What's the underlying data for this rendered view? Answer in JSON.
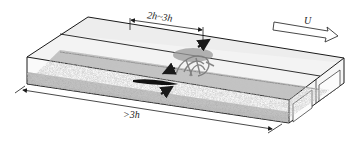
{
  "diagram": {
    "labels": {
      "spacing": "2h~3h",
      "length": ">3h",
      "flow": "U"
    },
    "elements": [
      {
        "name": "flume-channel",
        "description": "rectangular channel in perspective"
      },
      {
        "name": "sediment-bed",
        "description": "granular bed (stippled gray)"
      },
      {
        "name": "vortex-structure",
        "description": "hairpin-like vortex near bed"
      },
      {
        "name": "flow-arrows",
        "description": "three black arrows indicating ejection/sweep motions"
      },
      {
        "name": "spacing-dimension",
        "description": "dimension line marking 2h~3h on the top"
      },
      {
        "name": "length-dimension",
        "description": "dimension line marking >3h along the front bottom"
      },
      {
        "name": "flow-direction-arrow",
        "description": "hollow arrow labeled U pointing downstream"
      }
    ],
    "colors": {
      "line": "#1a1a1a",
      "sediment": "#b8b8b8",
      "wall": "#f2f2f2",
      "water": "#e6e6e6",
      "vortex": "#8a8a8a"
    }
  }
}
